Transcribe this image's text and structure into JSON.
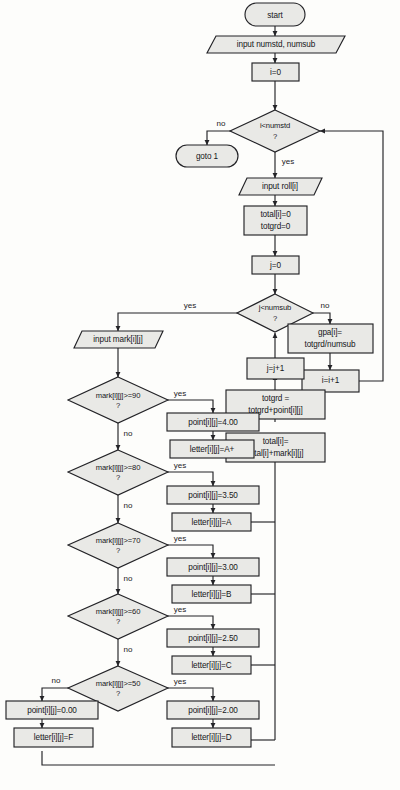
{
  "diagram": {
    "colors": {
      "node_fill": "#e9e9e6",
      "stroke": "#232327",
      "background": "#fdfdfb",
      "text": "#16161a"
    },
    "nodes": {
      "start": "start",
      "input_numstd_numsub": "input numstd, numsub",
      "i_init": "i=0",
      "cond_numstd_l1": "i<numstd",
      "cond_numstd_l2": "?",
      "goto1": "goto 1",
      "input_roll": "input roll[i]",
      "total_init_l1": "total[i]=0",
      "total_init_l2": "totgrd=0",
      "j_init": "j=0",
      "cond_numsub_l1": "j<numsub",
      "cond_numsub_l2": "?",
      "gpa_l1": "gpa[i]=",
      "gpa_l2": "totgrd/numsub",
      "i_incr": "i=i+1",
      "j_incr": "j=j+1",
      "totgrd_l1": "totgrd =",
      "totgrd_l2": "totgrd+point[i][j]",
      "total_acc_l1": "total[i]=",
      "total_acc_l2": "total[i]+mark[i][j]",
      "input_mark": "input mark[i][j]",
      "cond_90_l1": "mark[i][j]>=90",
      "cond_90_l2": "?",
      "point_400": "point[i][j]=4.00",
      "letter_aplus": "letter[i][j]=A+",
      "cond_80_l1": "mark[i][j]>=80",
      "cond_80_l2": "?",
      "point_350": "point[i][j]=3.50",
      "letter_a": "letter[i][j]=A",
      "cond_70_l1": "mark[i][j]>=70",
      "cond_70_l2": "?",
      "point_300": "point[i][j]=3.00",
      "letter_b": "letter[i][j]=B",
      "cond_60_l1": "mark[i][j]>=60",
      "cond_60_l2": "?",
      "point_250": "point[i][j]=2.50",
      "letter_c": "letter[i][j]=C",
      "cond_50_l1": "mark[i][j]>=50",
      "cond_50_l2": "?",
      "point_200": "point[i][j]=2.00",
      "letter_d": "letter[i][j]=D",
      "point_000": "point[i][j]=0.00",
      "letter_f": "letter[i][j]=F"
    },
    "edge_labels": {
      "numstd_no": "no",
      "numstd_yes": "yes",
      "numsub_yes": "yes",
      "numsub_no": "no",
      "c90_yes": "yes",
      "c90_no": "no",
      "c80_yes": "yes",
      "c80_no": "no",
      "c70_yes": "yes",
      "c70_no": "no",
      "c60_yes": "yes",
      "c60_no": "no",
      "c50_yes": "yes",
      "c50_no": "no"
    }
  }
}
